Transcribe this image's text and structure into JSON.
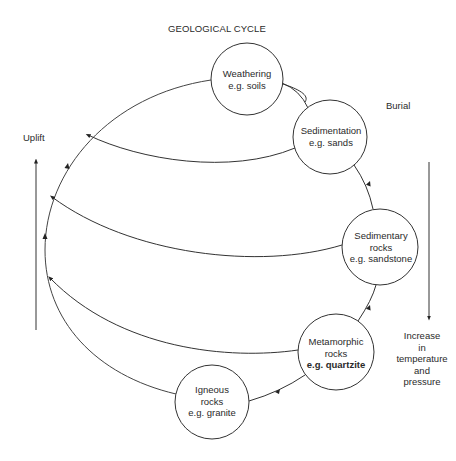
{
  "title": "GEOLOGICAL CYCLE",
  "nodes": [
    {
      "id": "weathering",
      "lines": [
        "Weathering",
        "e.g. soils"
      ],
      "cx": 247,
      "cy": 79,
      "r": 36
    },
    {
      "id": "sedimentation",
      "lines": [
        "Sedimentation",
        "e.g. sands"
      ],
      "cx": 330,
      "cy": 137,
      "r": 37
    },
    {
      "id": "sedimentary-rocks",
      "lines": [
        "Sedimentary",
        "rocks",
        "e.g. sandstone"
      ],
      "cx": 380,
      "cy": 247,
      "r": 38
    },
    {
      "id": "metamorphic-rocks",
      "lines": [
        "Metamorphic",
        "rocks",
        "e.g. quartzite"
      ],
      "cx": 336,
      "cy": 352,
      "r": 38
    },
    {
      "id": "igneous-rocks",
      "lines": [
        "Igneous",
        "rocks",
        "e.g. granite"
      ],
      "cx": 212,
      "cy": 402,
      "r": 37
    }
  ],
  "labels": {
    "uplift": "Uplift",
    "burial": "Burial",
    "increase": [
      "Increase",
      "in",
      "temperature",
      "and",
      "pressure"
    ]
  },
  "colors": {
    "line": "#333333",
    "text": "#2a2a2a",
    "background": "#ffffff"
  }
}
